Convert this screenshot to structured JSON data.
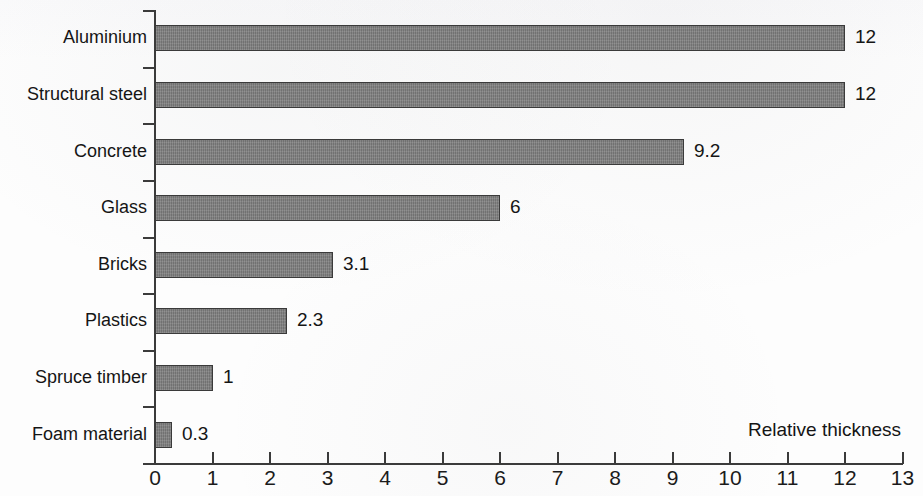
{
  "chart_data": {
    "type": "bar",
    "orientation": "horizontal",
    "title": "",
    "subtitle": "",
    "xlabel": "Relative thickness",
    "ylabel": "",
    "categories": [
      "Aluminium",
      "Structural steel",
      "Concrete",
      "Glass",
      "Bricks",
      "Plastics",
      "Spruce timber",
      "Foam material"
    ],
    "values": [
      12,
      12,
      9.2,
      6,
      3.1,
      2.3,
      1,
      0.3
    ],
    "value_labels": [
      "12",
      "12",
      "9.2",
      "6",
      "3.1",
      "2.3",
      "1",
      "0.3"
    ],
    "xlim": [
      0,
      13
    ],
    "xticks": [
      0,
      1,
      2,
      3,
      4,
      5,
      6,
      7,
      8,
      9,
      10,
      11,
      12,
      13
    ],
    "xticklabels": [
      "0",
      "1",
      "2",
      "3",
      "4",
      "5",
      "6",
      "7",
      "8",
      "9",
      "10",
      "11",
      "12",
      "13"
    ],
    "grid": false,
    "legend": null,
    "legend_position": "none",
    "colors": {
      "bar_fill": "#7c7c7c",
      "bar_edge": "#3a3a3a",
      "axis": "#3b3b3b",
      "text": "#151515",
      "background": "#fdfdfd"
    }
  },
  "axis_title": {
    "text": "Relative thickness"
  }
}
